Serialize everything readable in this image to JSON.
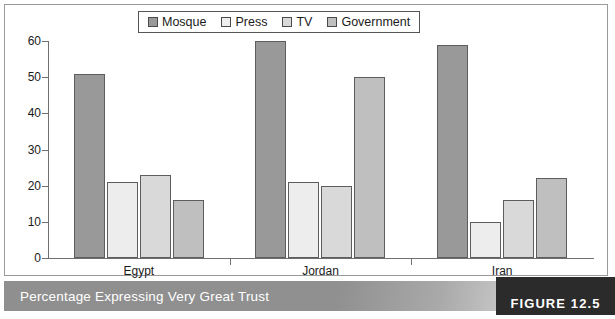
{
  "caption": {
    "text": "Percentage Expressing Very Great Trust",
    "figure_tag": "FIGURE 12.5"
  },
  "legend": {
    "items": [
      {
        "label": "Mosque",
        "color": "#999999"
      },
      {
        "label": "Press",
        "color": "#ededed"
      },
      {
        "label": "TV",
        "color": "#d9d9d9"
      },
      {
        "label": "Government",
        "color": "#bfbfbf"
      }
    ]
  },
  "chart_data": {
    "type": "bar",
    "title": "Percentage Expressing Very Great Trust",
    "xlabel": "",
    "ylabel": "",
    "ylim": [
      0,
      60
    ],
    "yticks": [
      0,
      10,
      20,
      30,
      40,
      50,
      60
    ],
    "grid": false,
    "legend_position": "top-center",
    "categories": [
      "Egypt",
      "Jordan",
      "Iran"
    ],
    "series": [
      {
        "name": "Mosque",
        "color": "#999999",
        "values": [
          51,
          60,
          59
        ]
      },
      {
        "name": "Press",
        "color": "#ededed",
        "values": [
          21,
          21,
          10
        ]
      },
      {
        "name": "TV",
        "color": "#d9d9d9",
        "values": [
          23,
          20,
          16
        ]
      },
      {
        "name": "Government",
        "color": "#bfbfbf",
        "values": [
          16,
          50,
          22
        ]
      }
    ]
  }
}
